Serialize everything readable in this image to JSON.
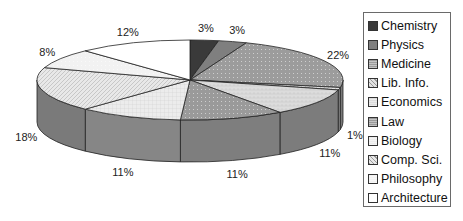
{
  "chart_data": {
    "type": "pie",
    "subtype": "3d-pie",
    "title": "",
    "start_angle_deg": -90,
    "direction": "clockwise",
    "legend_position": "right",
    "categories": [
      "Chemistry",
      "Physics",
      "Medicine",
      "Lib. Info.",
      "Economics",
      "Law",
      "Biology",
      "Comp. Sci.",
      "Philosophy",
      "Architecture"
    ],
    "values": [
      3,
      3,
      22,
      1,
      11,
      11,
      11,
      18,
      8,
      12
    ],
    "labels": [
      "3%",
      "3%",
      "22%",
      "1%",
      "11%",
      "11%",
      "11%",
      "18%",
      "8%",
      "12%"
    ],
    "colors": [
      "#3a3a3a",
      "#7f7f7f",
      "#9c9c9c",
      "#e2e2e2",
      "#dcdcdc",
      "#9a9a9a",
      "#ececec",
      "#e8e8e8",
      "#f2f2f2",
      "#ffffff"
    ],
    "side_colors": [
      "#2a2a2a",
      "#6a6a6a",
      "#7a7a7a",
      "#8a8a8a",
      "#7c7c7c",
      "#7e7e7e",
      "#868686",
      "#7a7a7a",
      "#8a8a8a",
      "#9a9a9a"
    ],
    "patterns": [
      "solid",
      "solid",
      "dots",
      "diag",
      "brick",
      "dots",
      "grid",
      "diag",
      "dots",
      "solid"
    ]
  },
  "legend": {
    "items": [
      "Chemistry",
      "Physics",
      "Medicine",
      "Lib. Info.",
      "Economics",
      "Law",
      "Biology",
      "Comp. Sci.",
      "Philosophy",
      "Architecture"
    ]
  }
}
